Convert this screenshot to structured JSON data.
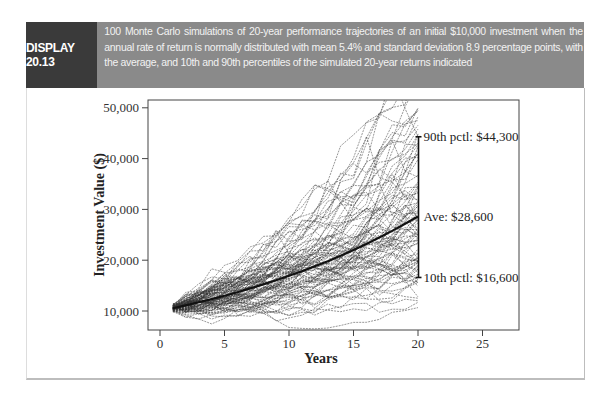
{
  "header": {
    "label": "DISPLAY 20.13",
    "caption": "100 Monte Carlo simulations of 20-year performance trajectories of an initial $10,000 investment when the annual rate of return is normally distributed with mean 5.4% and standard deviation 8.9 percentage points, with the average, and 10th and 90th percentiles of the simulated 20-year returns indicated"
  },
  "chart_data": {
    "type": "line",
    "title": "",
    "xlabel": "Years",
    "ylabel": "Investment Value ($)",
    "xlim": [
      -1,
      28
    ],
    "ylim": [
      8500,
      51800
    ],
    "xticks": [
      0,
      5,
      10,
      15,
      20,
      25
    ],
    "xtick_labels": [
      "0",
      "5",
      "10",
      "15",
      "20",
      "25"
    ],
    "yticks": [
      10000,
      20000,
      30000,
      40000,
      50000
    ],
    "ytick_labels": [
      "10,000",
      "20,000",
      "30,000",
      "40,000",
      "50,000"
    ],
    "n_simulations": 100,
    "initial_value": 10000,
    "mean_return": 0.054,
    "sd_return": 0.089,
    "years": 20,
    "average_path": {
      "x": [
        1,
        2,
        3,
        4,
        5,
        6,
        7,
        8,
        9,
        10,
        11,
        12,
        13,
        14,
        15,
        16,
        17,
        18,
        19,
        20
      ],
      "y": [
        10540,
        11110,
        11710,
        12340,
        13010,
        13710,
        14450,
        15230,
        16050,
        16920,
        17830,
        18800,
        19810,
        20880,
        22010,
        23200,
        24450,
        25770,
        27160,
        28600
      ]
    },
    "annotations": [
      {
        "label": "90th pctl: $44,300",
        "x": 20,
        "y": 44300
      },
      {
        "label": "Ave: $28,600",
        "x": 20,
        "y": 28600
      },
      {
        "label": "10th pctl: $16,600",
        "x": 20,
        "y": 16600
      }
    ],
    "grid": false,
    "legend": "none"
  }
}
